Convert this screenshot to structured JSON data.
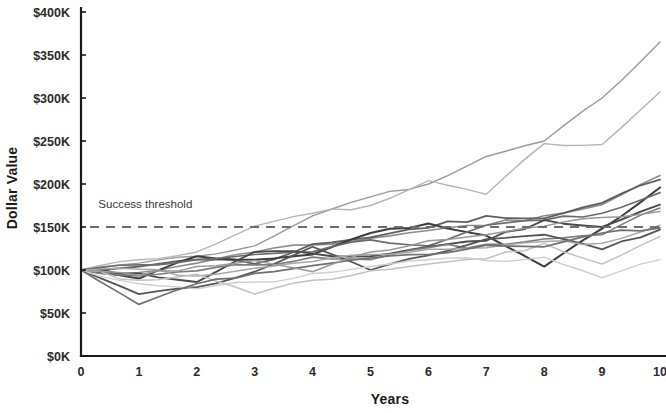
{
  "chart_data": {
    "type": "line",
    "title": "",
    "subtitle": "",
    "xlabel": "Years",
    "ylabel": "Dollar Value",
    "xlim": [
      0,
      10
    ],
    "ylim": [
      0,
      400
    ],
    "grid": false,
    "legend_position": "none",
    "x_tick_labels": [
      "0",
      "1",
      "2",
      "3",
      "4",
      "5",
      "6",
      "7",
      "8",
      "9",
      "10"
    ],
    "x": [
      0,
      1,
      2,
      3,
      4,
      5,
      6,
      7,
      8,
      9,
      10
    ],
    "y_tick_labels": [
      "$0K",
      "$50K",
      "$100K",
      "$150K",
      "$200K",
      "$250K",
      "$300K",
      "$350K",
      "$400K"
    ],
    "y_tick_values": [
      0,
      50,
      100,
      150,
      200,
      250,
      300,
      350,
      400
    ],
    "units": "thousands of dollars",
    "value_scale_note": "series values are in $K (thousands)",
    "annotations": [
      {
        "text": "Success threshold",
        "x": 0.3,
        "y": 172,
        "type": "label"
      }
    ],
    "reference_lines": [
      {
        "name": "Success threshold",
        "orientation": "horizontal",
        "value": 150,
        "style": "dashed",
        "color": "#6e6e6e"
      }
    ],
    "series": [
      {
        "name": "Path 1",
        "color": "#9a9a9a",
        "width": 1.4,
        "values": [
          100,
          108,
          116,
          128,
          163,
          185,
          200,
          232,
          250,
          300,
          365
        ]
      },
      {
        "name": "Path 2",
        "color": "#b5b5b5",
        "width": 1.4,
        "values": [
          100,
          112,
          121,
          151,
          166,
          175,
          204,
          188,
          247,
          246,
          307
        ]
      },
      {
        "name": "Path 3",
        "color": "#8c8c8c",
        "width": 1.6,
        "values": [
          100,
          97,
          108,
          121,
          129,
          137,
          146,
          152,
          163,
          176,
          210
        ]
      },
      {
        "name": "Path 4",
        "color": "#5f5f5f",
        "width": 1.8,
        "values": [
          100,
          104,
          112,
          107,
          130,
          138,
          149,
          163,
          160,
          178,
          205
        ]
      },
      {
        "name": "Path 5",
        "color": "#3d3d3d",
        "width": 2.0,
        "values": [
          100,
          90,
          116,
          112,
          118,
          143,
          154,
          140,
          104,
          148,
          196
        ]
      },
      {
        "name": "Path 6",
        "color": "#6b6b6b",
        "width": 1.7,
        "values": [
          100,
          106,
          112,
          118,
          121,
          135,
          128,
          152,
          158,
          166,
          190
        ]
      },
      {
        "name": "Path 7",
        "color": "#4a4a4a",
        "width": 1.9,
        "values": [
          100,
          96,
          86,
          121,
          119,
          116,
          127,
          134,
          158,
          150,
          176
        ]
      },
      {
        "name": "Path 8",
        "color": "#7d7d7d",
        "width": 1.6,
        "values": [
          100,
          93,
          99,
          106,
          115,
          112,
          126,
          130,
          136,
          141,
          172
        ]
      },
      {
        "name": "Path 9",
        "color": "#555555",
        "width": 1.8,
        "values": [
          100,
          72,
          80,
          98,
          127,
          100,
          117,
          136,
          141,
          124,
          147
        ]
      },
      {
        "name": "Path 10",
        "color": "#a8a8a8",
        "width": 1.5,
        "values": [
          100,
          101,
          93,
          102,
          110,
          118,
          124,
          126,
          133,
          131,
          152
        ]
      },
      {
        "name": "Path 11",
        "color": "#c2c2c2",
        "width": 1.5,
        "values": [
          100,
          88,
          95,
          72,
          88,
          99,
          107,
          113,
          131,
          107,
          139
        ]
      },
      {
        "name": "Path 12",
        "color": "#cfcfcf",
        "width": 1.4,
        "values": [
          100,
          84,
          78,
          86,
          96,
          104,
          112,
          111,
          115,
          91,
          112
        ]
      },
      {
        "name": "Path 13",
        "color": "#707070",
        "width": 1.7,
        "values": [
          100,
          60,
          84,
          96,
          105,
          114,
          118,
          129,
          127,
          143,
          149
        ]
      },
      {
        "name": "Path 14",
        "color": "#999999",
        "width": 1.5,
        "values": [
          100,
          94,
          104,
          111,
          98,
          121,
          134,
          141,
          151,
          161,
          168
        ]
      }
    ]
  },
  "axes": {
    "y_title": "Dollar Value",
    "x_title": "Years"
  }
}
